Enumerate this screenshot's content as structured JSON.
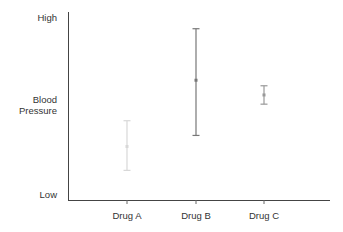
{
  "chart_data": {
    "type": "errorbar",
    "title": "",
    "xlabel": "",
    "ylabel": "Blood Pressure",
    "y_tick_labels": {
      "top": "High",
      "middle": "Blood Pressure",
      "bottom": "Low"
    },
    "categories": [
      "Drug A",
      "Drug B",
      "Drug C"
    ],
    "ylim": [
      0,
      100
    ],
    "series": [
      {
        "name": "Drug A",
        "center": 28,
        "low": 15,
        "high": 42,
        "color": "#d8d8d8"
      },
      {
        "name": "Drug B",
        "center": 64,
        "low": 34,
        "high": 92,
        "color": "#777777"
      },
      {
        "name": "Drug C",
        "center": 56,
        "low": 51,
        "high": 61,
        "color": "#999999"
      }
    ],
    "grid": false,
    "legend": "none"
  },
  "axis": {
    "y_high": "High",
    "y_mid_line1": "Blood",
    "y_mid_line2": "Pressure",
    "y_low": "Low",
    "x_labels": [
      "Drug A",
      "Drug B",
      "Drug C"
    ]
  }
}
